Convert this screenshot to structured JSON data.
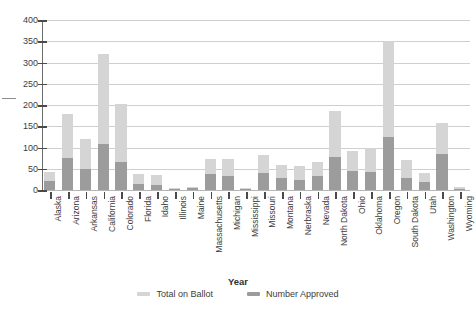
{
  "chart_data": {
    "type": "bar",
    "title": "",
    "subtitle": "",
    "xlabel": "Year",
    "ylabel": "",
    "ylim": [
      0,
      400
    ],
    "yticks": [
      0,
      50,
      100,
      150,
      200,
      250,
      300,
      350,
      400
    ],
    "grid": true,
    "stacked": false,
    "overlay": true,
    "legend_position": "bottom",
    "legend": [
      "Total on Ballot",
      "Number Approved"
    ],
    "colors": {
      "total_on_ballot": "#d5d5d5",
      "number_approved": "#9c9c9c",
      "gridline": "#cfcfcf",
      "axis": "#6e6e6e",
      "text": "#3c3c3c"
    },
    "categories": [
      "Alaska",
      "Arizona",
      "Arkansas",
      "California",
      "Colorado",
      "Florida",
      "Idaho",
      "Illinois",
      "Maine",
      "Massachusetts",
      "Michigan",
      "Mississippi",
      "Missouri",
      "Montana",
      "Nerbraska",
      "Nevada",
      "North Dakota",
      "Ohio",
      "Oklahoma",
      "Oregon",
      "South Dakota",
      "Utah",
      "Washington",
      "Wyoming"
    ],
    "series": [
      {
        "name": "Total on Ballot",
        "values": [
          42,
          178,
          120,
          320,
          202,
          38,
          35,
          4,
          8,
          72,
          72,
          4,
          82,
          60,
          56,
          66,
          185,
          92,
          100,
          350,
          70,
          40,
          158,
          6
        ]
      },
      {
        "name": "Number Approved",
        "values": [
          22,
          76,
          50,
          108,
          66,
          14,
          12,
          2,
          4,
          38,
          34,
          2,
          40,
          28,
          24,
          32,
          78,
          44,
          42,
          125,
          28,
          18,
          85,
          2
        ]
      }
    ]
  },
  "legend": {
    "items": [
      {
        "label": "Total on Ballot",
        "color": "#d5d5d5"
      },
      {
        "label": "Number Approved",
        "color": "#9c9c9c"
      }
    ]
  },
  "axes": {
    "x_title": "Year"
  }
}
